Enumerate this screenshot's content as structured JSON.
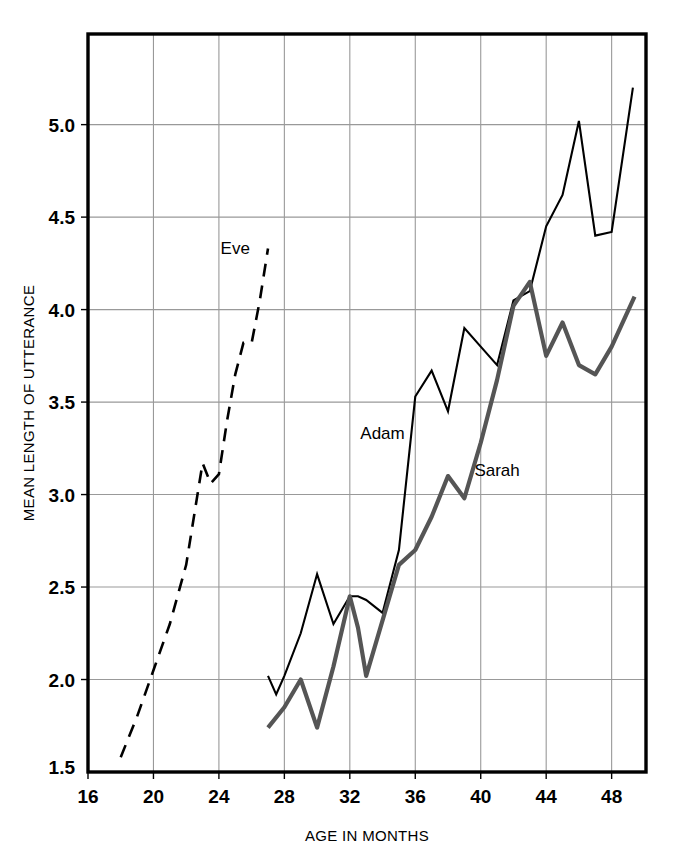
{
  "chart_data": {
    "type": "line",
    "title": "",
    "xlabel": "AGE IN MONTHS",
    "ylabel": "MEAN LENGTH OF UTTERANCE",
    "xlim": [
      16,
      50.1
    ],
    "ylim": [
      1.5,
      5.49
    ],
    "xticks": [
      16,
      20,
      24,
      28,
      32,
      36,
      40,
      44,
      48
    ],
    "xtick_labels": [
      "16",
      "20",
      "24",
      "28",
      "32",
      "36",
      "40",
      "44",
      "48"
    ],
    "yticks": [
      2.0,
      2.5,
      3.0,
      3.5,
      4.0,
      4.5,
      5.0
    ],
    "ytick_labels": [
      "2.0",
      "2.5",
      "3.0",
      "3.5",
      "4.0",
      "4.5",
      "5.0"
    ],
    "ymin_label": "1.5",
    "grid": true,
    "grid_color": "#999999",
    "frame_color": "#000000",
    "legend_position": "inline-annotations",
    "series": [
      {
        "name": "Eve",
        "style": "dashed",
        "color": "#000000",
        "width": 2.6,
        "label_x": 25.0,
        "label_y": 4.3,
        "x": [
          18.0,
          19.0,
          20.0,
          21.0,
          22.0,
          23.0,
          23.5,
          24.0,
          24.5,
          25.0,
          25.5,
          26.0,
          26.5,
          27.0
        ],
        "y": [
          1.58,
          1.8,
          2.05,
          2.3,
          2.62,
          3.17,
          3.06,
          3.11,
          3.4,
          3.65,
          3.82,
          3.82,
          4.05,
          4.33
        ]
      },
      {
        "name": "Adam",
        "style": "solid-thin",
        "color": "#000000",
        "width": 2.1,
        "label_x": 34.0,
        "label_y": 3.3,
        "x": [
          27.0,
          27.5,
          28.0,
          29.0,
          30.0,
          31.0,
          32.0,
          32.5,
          33.0,
          34.0,
          35.0,
          36.0,
          37.0,
          38.0,
          39.0,
          40.0,
          41.0,
          42.0,
          43.0,
          44.0,
          45.0,
          46.0,
          47.0,
          48.0,
          49.3
        ],
        "y": [
          2.02,
          1.92,
          2.02,
          2.25,
          2.57,
          2.3,
          2.45,
          2.45,
          2.43,
          2.36,
          2.7,
          3.53,
          3.67,
          3.45,
          3.9,
          3.8,
          3.7,
          4.05,
          4.1,
          4.45,
          4.62,
          5.02,
          4.4,
          4.42,
          5.2
        ]
      },
      {
        "name": "Sarah",
        "style": "solid-thick",
        "color": "#555555",
        "width": 4.2,
        "label_x": 41.0,
        "label_y": 3.1,
        "x": [
          27.0,
          28.0,
          29.0,
          30.0,
          31.0,
          32.0,
          32.5,
          33.0,
          34.0,
          35.0,
          36.0,
          37.0,
          38.0,
          39.0,
          40.0,
          41.0,
          42.0,
          43.0,
          44.0,
          45.0,
          46.0,
          47.0,
          48.0,
          49.4
        ],
        "y": [
          1.74,
          1.85,
          2.0,
          1.74,
          2.07,
          2.45,
          2.28,
          2.02,
          2.32,
          2.62,
          2.7,
          2.88,
          3.1,
          2.98,
          3.28,
          3.62,
          4.02,
          4.15,
          3.75,
          3.93,
          3.7,
          3.65,
          3.8,
          4.07
        ]
      }
    ]
  }
}
